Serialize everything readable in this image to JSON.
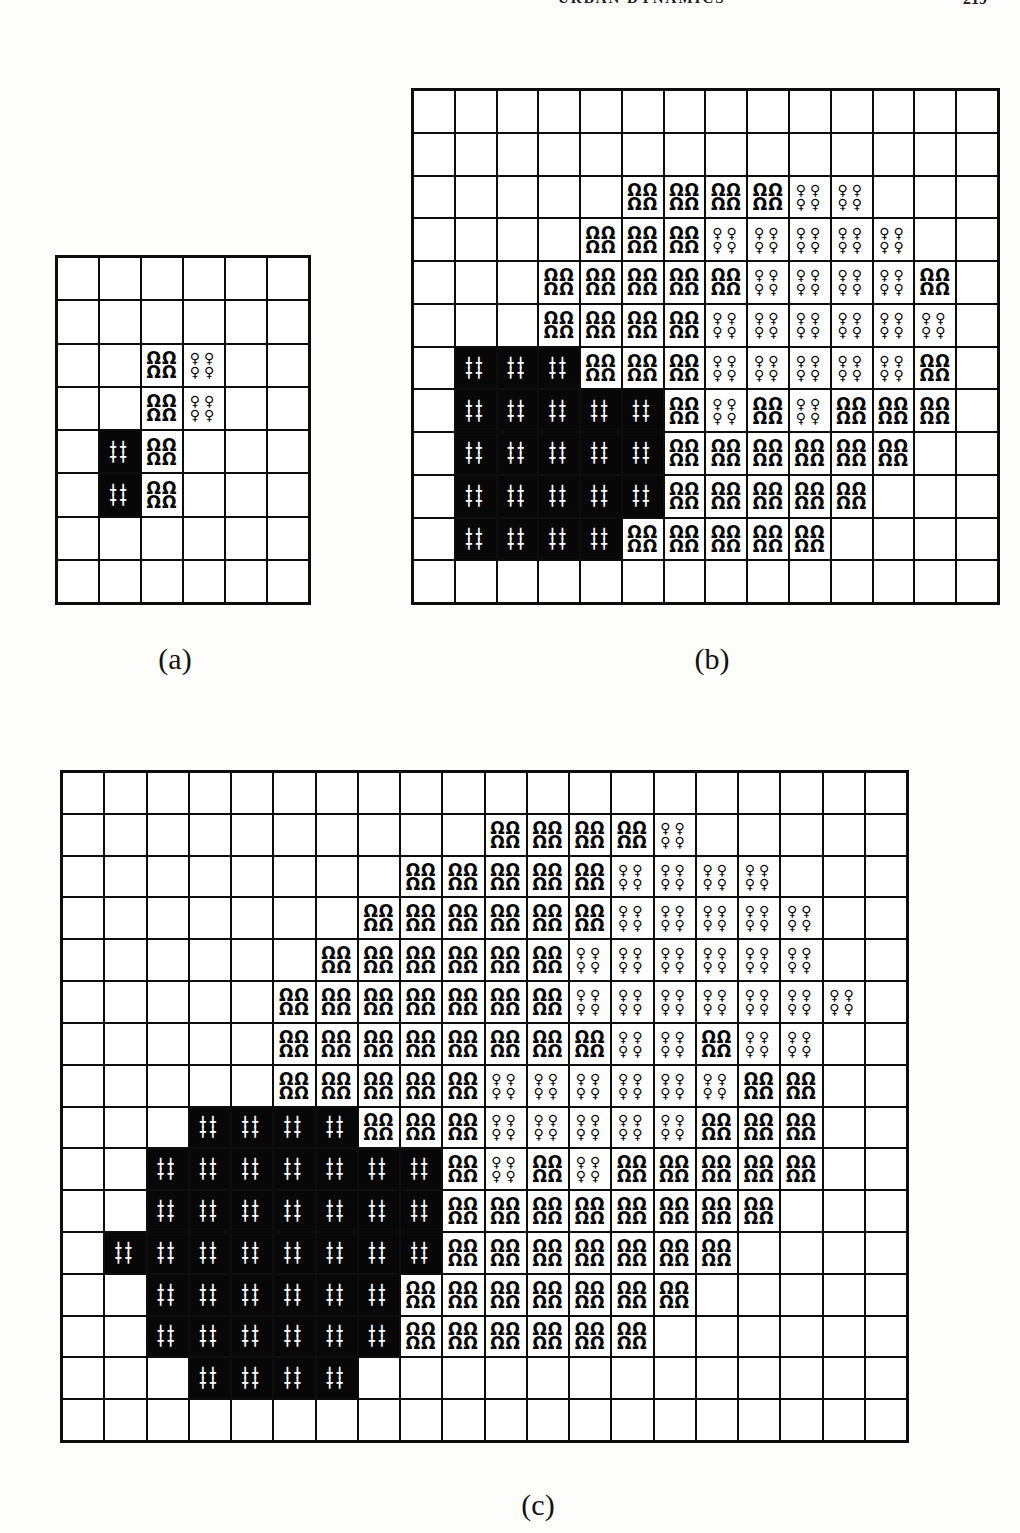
{
  "header": {
    "running_head": "URBAN DYNAMICS",
    "page_number": "219"
  },
  "figure": {
    "description": "Three grid panels showing simulated growth states on a cell lattice",
    "pattern_glyphs": {
      "B": "╋",
      "D": "Ω",
      "Q": "♀"
    },
    "legend": {
      "B": "solid black cell with white cross marks",
      "D": "arch (omega) halftone texture",
      "Q": "sparse circle-with-stem halftone texture",
      "E": "empty white cell"
    },
    "panels": [
      {
        "id": "a",
        "label": "(a)",
        "cols": 6,
        "rows": 8,
        "cells": [
          "......",
          "......",
          "..DQ..",
          "..DQ..",
          ".BD...",
          ".BD...",
          "......",
          "......"
        ]
      },
      {
        "id": "b",
        "label": "(b)",
        "cols": 14,
        "rows": 12,
        "cells": [
          "..............",
          "..............",
          ".....DDDDQQ...",
          "....DDDQQQQQ..",
          "...DDDDDQQQQD.",
          "...DDDDQQQQQQ.",
          ".BBBDDDQQQQQD.",
          ".BBBBBDQDQDDD.",
          ".BBBBBDDDDDD..",
          ".BBBBBDDDDD...",
          ".BBBBDDDDD....",
          ".............."
        ]
      },
      {
        "id": "c",
        "label": "(c)",
        "cols": 20,
        "rows": 16,
        "cells": [
          "....................",
          "..........DDDDQ.....",
          "........DDDDDQQQQ...",
          ".......DDDDDDQQQQQ..",
          "......DDDDDDQQQQQQ..",
          ".....DDDDDDDQQQQQQQ.",
          ".....DDDDDDDDQQDQQ..",
          ".....DDDDDQQQQQQDD..",
          "...BBBBDDDQQQQQDDD..",
          "..BBBBBBBDQDQDDDDD..",
          "..BBBBBBBDDDDDDDD...",
          ".BBBBBBBBDDDDDDD....",
          "..BBBBBBDDDDDDD.....",
          "..BBBBBBDDDDDD......",
          "...BBBB.............",
          "...................."
        ]
      }
    ]
  }
}
